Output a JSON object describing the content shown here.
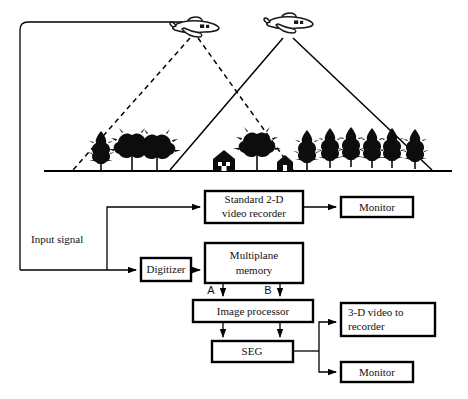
{
  "figure": {
    "scene": {
      "aircraft": [
        {
          "name": "left-aircraft",
          "label": ""
        },
        {
          "name": "right-aircraft",
          "label": ""
        }
      ],
      "ground_label": "",
      "left_cone_style": "dashed",
      "right_cone_style": "solid"
    },
    "labels": {
      "input_signal": "Input signal",
      "port_a": "A",
      "port_b": "B"
    },
    "boxes": {
      "video_recorder": "Standard 2-D\nvideo recorder",
      "video_recorder_line1": "Standard 2-D",
      "video_recorder_line2": "video recorder",
      "monitor_top": "Monitor",
      "digitizer": "Digitizer",
      "multiplane_memory_line1": "Multiplane",
      "multiplane_memory_line2": "memory",
      "image_processor": "Image processor",
      "seg": "SEG",
      "video_3d_line1": "3-D video to",
      "video_3d_line2": "recorder",
      "monitor_bottom": "Monitor"
    },
    "colors": {
      "ink": "#000000",
      "paper": "#ffffff"
    }
  }
}
